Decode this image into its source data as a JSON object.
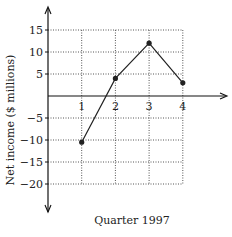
{
  "chart_data": {
    "type": "line",
    "title": "",
    "xlabel": "Quarter 1997",
    "ylabel": "Net income ($ millions)",
    "x": [
      1,
      2,
      3,
      4
    ],
    "categories": [
      "1",
      "2",
      "3",
      "4"
    ],
    "values": [
      -10.5,
      4,
      12,
      3
    ],
    "series": [
      {
        "name": "Net income",
        "values": [
          -10.5,
          4,
          12,
          3
        ]
      }
    ],
    "ylim": [
      -20,
      15
    ],
    "xlim": [
      0,
      4
    ],
    "yticks": [
      15,
      10,
      5,
      -5,
      -10,
      -15,
      -20
    ],
    "ytick_labels": [
      "15",
      "10",
      "5",
      "−5",
      "−10",
      "−15",
      "−20"
    ],
    "xticks": [
      1,
      2,
      3,
      4
    ],
    "grid": true,
    "grid_style": "dotted",
    "legend": null,
    "colors": {
      "line": "#222222",
      "grid": "#555555",
      "axis": "#111111"
    }
  }
}
